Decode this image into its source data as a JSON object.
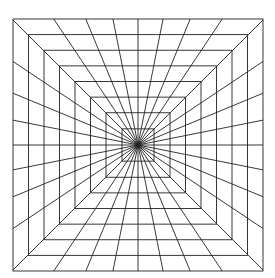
{
  "figure": {
    "title": "Concentric squares with radial spokes (tunnel perspective grid)",
    "background": "#ffffff",
    "stroke_color": "#222222",
    "stroke_width": 0.9,
    "center": {
      "x": 138,
      "y": 145
    },
    "outer_square": {
      "x": 13,
      "y": 19,
      "width": 250,
      "height": 252
    },
    "square_count": 8,
    "square_half_sizes": [
      125,
      109.5,
      94,
      78.5,
      63,
      47.5,
      32,
      16
    ],
    "spoke_count": 32,
    "spoke_angle_step_deg": 11.25
  }
}
